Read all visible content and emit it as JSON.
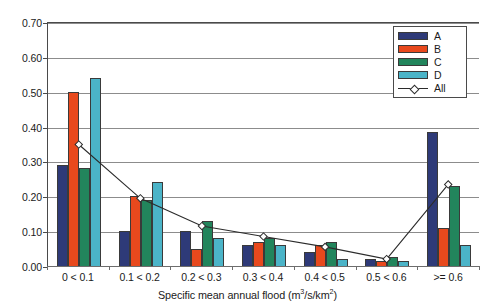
{
  "chart_data": {
    "type": "bar",
    "title": "",
    "subtitle": "",
    "xlabel": "Specific mean annual flood (m3/s/km2)",
    "xlabel_html": "Specific mean annual flood (m<sup>3</sup>/s/km<sup>2</sup>)",
    "ylabel": "",
    "ylim": [
      0.0,
      0.7
    ],
    "ytick_labels": [
      "0.00",
      "0.10",
      "0.20",
      "0.30",
      "0.40",
      "0.50",
      "0.60",
      "0.70"
    ],
    "ytick_values": [
      0.0,
      0.1,
      0.2,
      0.3,
      0.4,
      0.5,
      0.6,
      0.7
    ],
    "grid": true,
    "grid_axis": "y",
    "legend_position": "top-right",
    "categories": [
      "0 < 0.1",
      "0.1 < 0.2",
      "0.2 < 0.3",
      "0.3 < 0.4",
      "0.4 < 0.5",
      "0.5 < 0.6",
      ">= 0.6"
    ],
    "series": [
      {
        "name": "A",
        "type": "bar",
        "color": "#2e3a78",
        "values": [
          0.29,
          0.1,
          0.1,
          0.06,
          0.04,
          0.02,
          0.385
        ]
      },
      {
        "name": "B",
        "type": "bar",
        "color": "#e8491d",
        "values": [
          0.5,
          0.2,
          0.05,
          0.07,
          0.06,
          0.015,
          0.11
        ]
      },
      {
        "name": "C",
        "type": "bar",
        "color": "#22855c",
        "values": [
          0.28,
          0.19,
          0.13,
          0.08,
          0.07,
          0.025,
          0.23
        ]
      },
      {
        "name": "D",
        "type": "bar",
        "color": "#4bb4c8",
        "values": [
          0.54,
          0.24,
          0.08,
          0.06,
          0.02,
          0.015,
          0.06
        ]
      },
      {
        "name": "All",
        "type": "line",
        "color": "#2b2b2b",
        "marker": "diamond",
        "values": [
          0.35,
          0.195,
          0.115,
          0.085,
          0.055,
          0.02,
          0.235
        ]
      }
    ]
  },
  "legend": {
    "entries": [
      {
        "label": "A",
        "kind": "swatch"
      },
      {
        "label": "B",
        "kind": "swatch"
      },
      {
        "label": "C",
        "kind": "swatch"
      },
      {
        "label": "D",
        "kind": "swatch"
      },
      {
        "label": "All",
        "kind": "line-marker"
      }
    ]
  },
  "colors": {
    "series_a": "#2e3a78",
    "series_b": "#e8491d",
    "series_c": "#22855c",
    "series_d": "#4bb4c8",
    "series_all": "#2b2b2b",
    "axis": "#4a4a4a",
    "gridline": "#8c8c8c",
    "background": "#ffffff"
  }
}
